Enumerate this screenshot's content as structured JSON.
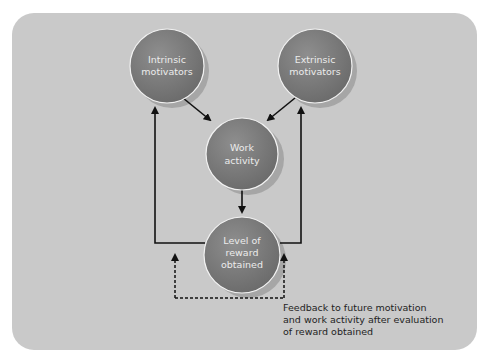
{
  "diagram": {
    "title": "",
    "nodes": [
      {
        "id": "intrinsic",
        "lines": [
          "Intrinsic",
          "motivators"
        ]
      },
      {
        "id": "extrinsic",
        "lines": [
          "Extrinsic",
          "motivators"
        ]
      },
      {
        "id": "work",
        "lines": [
          "Work",
          "activity"
        ]
      },
      {
        "id": "reward",
        "lines": [
          "Level of",
          "reward",
          "obtained"
        ]
      }
    ],
    "edges": [
      {
        "from": "intrinsic",
        "to": "work",
        "style": "solid"
      },
      {
        "from": "extrinsic",
        "to": "work",
        "style": "solid"
      },
      {
        "from": "work",
        "to": "reward",
        "style": "solid"
      },
      {
        "from": "reward",
        "to": "intrinsic",
        "style": "solid"
      },
      {
        "from": "reward",
        "to": "extrinsic",
        "style": "solid"
      },
      {
        "from": "feedback-loop",
        "to": "reward-sides",
        "style": "dashed"
      }
    ],
    "caption": {
      "lines": [
        "Feedback to future motivation",
        "and work activity after evaluation",
        "of reward obtained"
      ]
    },
    "colors": {
      "panel": "#c9c9c9",
      "node_fill": "#7a7a7a",
      "node_edge": "#f2f2f2",
      "arrow": "#111111"
    }
  }
}
